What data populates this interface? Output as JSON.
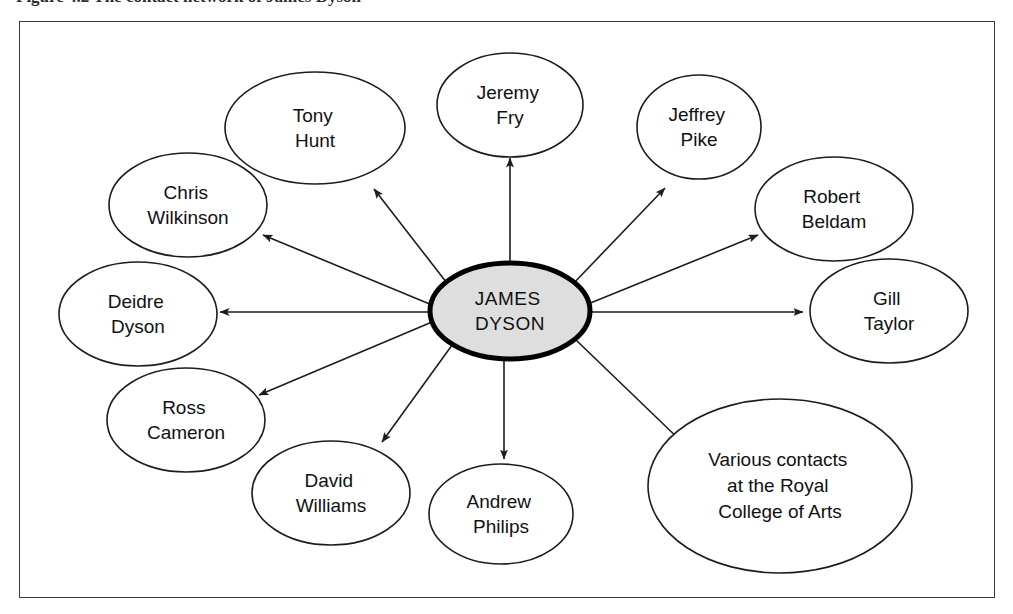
{
  "caption": {
    "text": "Figure 4.2  The contact network of James Dyson"
  },
  "diagram": {
    "type": "hub-and-spoke-network",
    "arrow_direction": "outward-from-center",
    "colors": {
      "center_fill": "#dedede",
      "center_stroke": "#000000",
      "node_fill": "#ffffff",
      "node_stroke": "#1d1d1d",
      "frame_stroke": "#3a3a3a",
      "text": "#111111"
    },
    "center": {
      "id": "james-dyson",
      "lines": [
        "JAMES",
        "DYSON"
      ],
      "cx": 509,
      "cy": 310,
      "rx": 80,
      "ry": 48
    },
    "nodes": [
      {
        "id": "tony-hunt",
        "lines": [
          "Tony",
          "Hunt"
        ],
        "cx": 314,
        "cy": 127,
        "rx": 90,
        "ry": 56
      },
      {
        "id": "jeremy-fry",
        "lines": [
          "Jeremy",
          "Fry"
        ],
        "cx": 509,
        "cy": 104,
        "rx": 73,
        "ry": 52
      },
      {
        "id": "jeffrey-pike",
        "lines": [
          "Jeffrey",
          "Pike"
        ],
        "cx": 698,
        "cy": 126,
        "rx": 62,
        "ry": 52
      },
      {
        "id": "chris-wilkinson",
        "lines": [
          "Chris",
          "Wilkinson"
        ],
        "cx": 187,
        "cy": 204,
        "rx": 79,
        "ry": 52
      },
      {
        "id": "robert-beldam",
        "lines": [
          "Robert",
          "Beldam"
        ],
        "cx": 833,
        "cy": 208,
        "rx": 79,
        "ry": 52
      },
      {
        "id": "deidre-dyson",
        "lines": [
          "Deidre",
          "Dyson"
        ],
        "cx": 137,
        "cy": 313,
        "rx": 79,
        "ry": 52
      },
      {
        "id": "gill-taylor",
        "lines": [
          "Gill",
          "Taylor"
        ],
        "cx": 888,
        "cy": 310,
        "rx": 79,
        "ry": 52
      },
      {
        "id": "ross-cameron",
        "lines": [
          "Ross",
          "Cameron"
        ],
        "cx": 185,
        "cy": 419,
        "rx": 79,
        "ry": 52
      },
      {
        "id": "david-williams",
        "lines": [
          "David",
          "Williams"
        ],
        "cx": 330,
        "cy": 492,
        "rx": 79,
        "ry": 52
      },
      {
        "id": "andrew-philips",
        "lines": [
          "Andrew",
          "Philips"
        ],
        "cx": 500,
        "cy": 513,
        "rx": 72,
        "ry": 50
      },
      {
        "id": "royal-college",
        "lines": [
          "Various contacts",
          "at the Royal",
          "College of Arts"
        ],
        "cx": 779,
        "cy": 485,
        "rx": 132,
        "ry": 87
      }
    ]
  }
}
